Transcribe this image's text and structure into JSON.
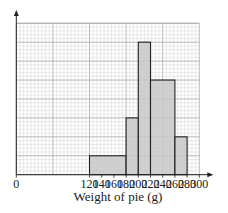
{
  "chart_data": {
    "type": "histogram",
    "title": "",
    "xlabel": "Weight of pie (g)",
    "ylabel": "",
    "x_ticks": [
      0,
      120,
      140,
      160,
      180,
      200,
      220,
      240,
      260,
      280,
      300
    ],
    "x_tick_labels": [
      "0",
      "120",
      "140",
      "160",
      "180",
      "200",
      "220",
      "240",
      "260",
      "280",
      "300"
    ],
    "xlim": [
      0,
      300
    ],
    "y_ticks_labeled": false,
    "y_units": "major grid squares (frequency density, unlabeled)",
    "ylim": [
      0,
      8
    ],
    "grid": true,
    "bins": [
      {
        "from": 120,
        "to": 180,
        "height": 1
      },
      {
        "from": 180,
        "to": 200,
        "height": 3
      },
      {
        "from": 200,
        "to": 220,
        "height": 7
      },
      {
        "from": 220,
        "to": 260,
        "height": 5
      },
      {
        "from": 260,
        "to": 280,
        "height": 2
      }
    ],
    "colors": {
      "bar_fill": "#c8c8c8",
      "bar_edge": "#222222",
      "grid_minor": "#d4d4d4",
      "grid_major": "#a8a8a8",
      "axis": "#222222"
    }
  }
}
